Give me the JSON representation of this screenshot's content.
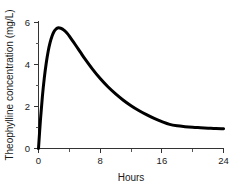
{
  "chart_data": {
    "type": "line",
    "title": "",
    "xlabel": "Hours",
    "ylabel": "Theophylline concentration (mg/L)",
    "xlim": [
      0,
      24
    ],
    "ylim": [
      0,
      6.3
    ],
    "grid": false,
    "legend": false,
    "xticks": [
      0,
      8,
      16,
      24
    ],
    "xtick_labels": [
      "0",
      "8",
      "16",
      "24"
    ],
    "xminor_ticks": [
      4,
      12,
      20
    ],
    "yticks": [
      0,
      2,
      4,
      6
    ],
    "ytick_labels": [
      "0",
      "2",
      "4",
      "6"
    ],
    "yminor_ticks": [
      1,
      3,
      5
    ],
    "series": [
      {
        "name": "Theophylline concentration",
        "color": "#000000",
        "linewidth": 3,
        "x": [
          0,
          0.25,
          0.5,
          0.75,
          1,
          1.25,
          1.5,
          1.75,
          2,
          2.25,
          2.5,
          2.75,
          3,
          3.25,
          3.5,
          3.75,
          4,
          4.5,
          5,
          5.5,
          6,
          7,
          8,
          9,
          10,
          11,
          12,
          13,
          14,
          15,
          16,
          17,
          18,
          19,
          20,
          21,
          22,
          23,
          24
        ],
        "y": [
          0.0,
          1.35,
          2.46,
          3.35,
          4.06,
          4.62,
          5.04,
          5.35,
          5.56,
          5.68,
          5.74,
          5.74,
          5.71,
          5.65,
          5.57,
          5.47,
          5.35,
          5.09,
          4.82,
          4.55,
          4.28,
          3.78,
          3.33,
          2.94,
          2.6,
          2.3,
          2.04,
          1.81,
          1.61,
          1.43,
          1.28,
          1.15,
          1.08,
          1.04,
          1.01,
          0.99,
          0.97,
          0.95,
          0.94
        ]
      }
    ],
    "annotations": {
      "peak_value": "5.74",
      "peak_time": "2.6",
      "value_at_24h": "0.94",
      "value_at_0h": "0.0"
    },
    "spines": [
      "left",
      "bottom"
    ]
  }
}
